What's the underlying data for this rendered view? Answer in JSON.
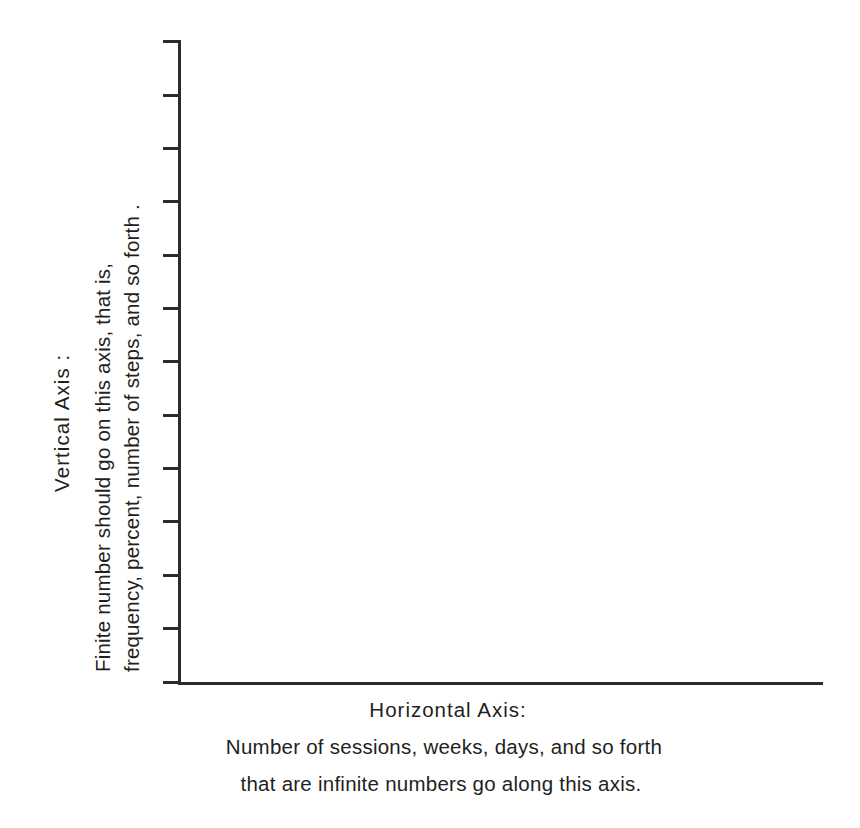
{
  "chart_data": {
    "type": "line",
    "title": "",
    "subtitle": "",
    "series": [],
    "categories": [],
    "values": [],
    "x": [],
    "xlabel": "Horizontal Axis: Number of sessions, weeks, days, and so forth that are infinite numbers go along this axis.",
    "ylabel": "Vertical Axis : Finite number should go on this axis, that is, frequency, percent, number of steps, and so forth .",
    "xlim": [],
    "ylim": [],
    "grid": false,
    "legend": null,
    "x_tick_labels": [],
    "y_tick_labels": [],
    "y_tick_count": 13,
    "annotations": [],
    "note": "Blank instructional axes template - no data plotted; both axes are unlabeled with numeric values."
  },
  "axes": {
    "vertical": {
      "heading": "Vertical Axis :",
      "description_line_1": "Finite number should go on this axis, that is,",
      "description_line_2": "frequency, percent, number of steps, and so forth ."
    },
    "horizontal": {
      "heading": "Horizontal Axis:",
      "description_line_1": "Number of sessions, weeks, days, and so forth",
      "description_line_2": "that are infinite numbers go along this axis."
    }
  },
  "style": {
    "background_color": "#ffffff",
    "ink_color": "#231f20",
    "axis_color": "#2b2b2b"
  },
  "ticks": {
    "y_positions": [
      40,
      94,
      147,
      200,
      254,
      307,
      360,
      414,
      467,
      520,
      574,
      627,
      681
    ]
  }
}
